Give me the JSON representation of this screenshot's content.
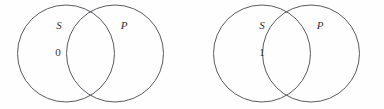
{
  "figure": {
    "background_color": "#fefefe",
    "stroke_color": "#5a5a60",
    "text_color": "#34343a",
    "diagrams": [
      {
        "name": "venn-diagram-left",
        "left_circle_label": "S",
        "right_circle_label": "P",
        "region_marker": "0",
        "region_marker_location": "S-only"
      },
      {
        "name": "venn-diagram-right",
        "left_circle_label": "S",
        "right_circle_label": "P",
        "region_marker": "1",
        "region_marker_location": "S-only"
      }
    ]
  }
}
